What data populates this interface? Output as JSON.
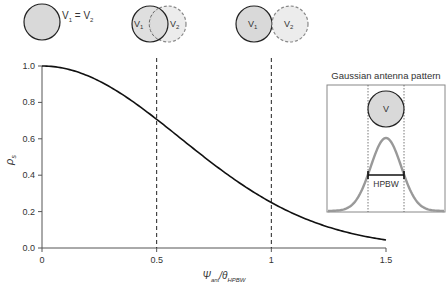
{
  "chart_data": {
    "type": "line",
    "title": "",
    "xlabel": "Ψ_ant/θ_HPBW",
    "ylabel": "ρ_s",
    "xlim": [
      0,
      1.5
    ],
    "ylim": [
      0,
      1.0
    ],
    "xticks": [
      "0",
      "0.5",
      "1",
      "1.5"
    ],
    "yticks": [
      "0.0",
      "0.2",
      "0.4",
      "0.6",
      "0.8",
      "1.0"
    ],
    "grid": false,
    "series": [
      {
        "name": "ρ_s",
        "x": [
          0,
          0.1,
          0.2,
          0.3,
          0.4,
          0.5,
          0.6,
          0.7,
          0.8,
          0.9,
          1.0,
          1.1,
          1.2,
          1.3,
          1.4,
          1.5
        ],
        "values": [
          1.0,
          0.986,
          0.946,
          0.883,
          0.801,
          0.707,
          0.607,
          0.507,
          0.412,
          0.325,
          0.25,
          0.187,
          0.136,
          0.096,
          0.066,
          0.044
        ]
      }
    ],
    "reference_lines": [
      {
        "x": 0.5,
        "style": "dashed"
      },
      {
        "x": 1.0,
        "style": "dashed"
      }
    ],
    "annotations": {
      "top_diagrams": [
        {
          "label_a": "V",
          "sub_a": "1",
          "eq": " = ",
          "label_b": "V",
          "sub_b": "2",
          "state": "overlapping-complete",
          "x": 0
        },
        {
          "label_a": "V",
          "sub_a": "1",
          "label_b": "V",
          "sub_b": "2",
          "state": "partial-overlap",
          "x": 0.5
        },
        {
          "label_a": "V",
          "sub_a": "1",
          "label_b": "V",
          "sub_b": "2",
          "state": "touching",
          "x": 1.0
        }
      ],
      "inset": {
        "title": "Gaussian antenna pattern",
        "circle_label": "V",
        "width_label": "HPBW"
      }
    }
  },
  "axes": {
    "x_label_main": "Ψ",
    "x_label_sub": "ant",
    "x_label_sep": "/θ",
    "x_label_sub2": "HPBW",
    "y_label_main": "ρ",
    "y_label_sub": "s"
  },
  "colors": {
    "curve": "#111111",
    "circle_fill": "#d9d9d9",
    "circle_stroke": "#222222",
    "dashed_circle_fill": "#ececec",
    "dashed_circle_stroke": "#888888",
    "gaussian": "#999999",
    "axis": "#555555"
  }
}
